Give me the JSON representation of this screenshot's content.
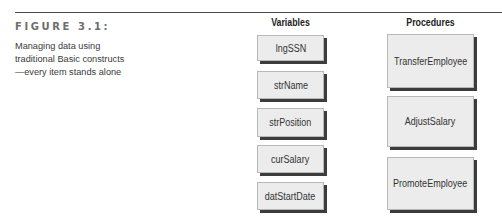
{
  "figure": {
    "label": "FIGURE 3.1:",
    "caption": "Managing data using traditional Basic constructs—every item stands alone"
  },
  "columns": {
    "variables": {
      "header": "Variables",
      "items": [
        "lngSSN",
        "strName",
        "strPosition",
        "curSalary",
        "datStartDate"
      ]
    },
    "procedures": {
      "header": "Procedures",
      "items": [
        "TransferEmployee",
        "AdjustSalary",
        "PromoteEmployee"
      ]
    }
  },
  "colors": {
    "box_fill": "#ececec",
    "box_shadow": "#3c3c3c",
    "rule": "#4a4a4a",
    "figure_label": "#6d6d6d"
  }
}
